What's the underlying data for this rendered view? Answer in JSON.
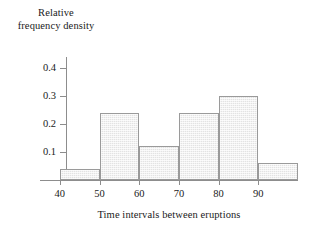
{
  "chart_data": {
    "type": "bar",
    "title": "",
    "subtitle": "",
    "xlabel": "Time intervals between eruptions",
    "ylabel": "Relative frequency density",
    "ylabel_line1": "Relative",
    "ylabel_line2": "frequency density",
    "grid": false,
    "legend": "none",
    "xlim": [
      35,
      100
    ],
    "ylim": [
      0,
      0.4
    ],
    "x_ticks": [
      40,
      50,
      60,
      70,
      80,
      90
    ],
    "x_tick_labels": [
      "40",
      "50",
      "60",
      "70",
      "80",
      "90"
    ],
    "y_ticks": [
      0.1,
      0.2,
      0.3,
      0.4
    ],
    "y_tick_labels": [
      "0.1",
      "0.2",
      "0.3",
      "0.4"
    ],
    "bin_edges": [
      40,
      50,
      60,
      70,
      80,
      90,
      100
    ],
    "categories": [
      "40-50",
      "50-60",
      "60-70",
      "70-80",
      "80-90",
      "90-100"
    ],
    "values": [
      0.04,
      0.24,
      0.12,
      0.24,
      0.3,
      0.06
    ],
    "bars": [
      {
        "label": "40-50",
        "start": 40,
        "end": 50,
        "value": 0.04
      },
      {
        "label": "50-60",
        "start": 50,
        "end": 60,
        "value": 0.24
      },
      {
        "label": "60-70",
        "start": 60,
        "end": 70,
        "value": 0.12
      },
      {
        "label": "70-80",
        "start": 70,
        "end": 80,
        "value": 0.24
      },
      {
        "label": "80-90",
        "start": 80,
        "end": 90,
        "value": 0.3
      },
      {
        "label": "90-100",
        "start": 90,
        "end": 100,
        "value": 0.06
      }
    ],
    "colors": {
      "bar_fill": "#e3e3e3",
      "bar_border": "#9a9a9a",
      "axis": "#8d8d8d",
      "text": "#1a1a1a",
      "background": "#ffffff"
    }
  }
}
